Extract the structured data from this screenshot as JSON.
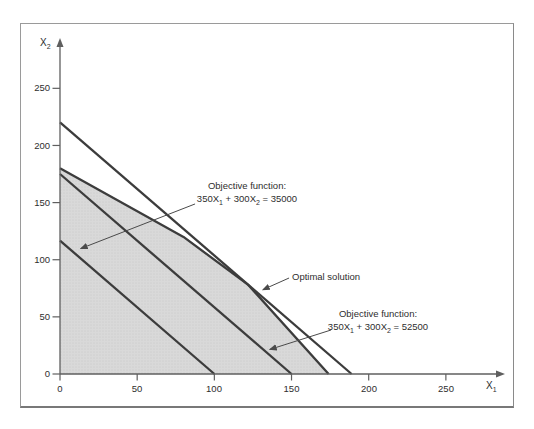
{
  "axes": {
    "x_axis_label": {
      "base": "X",
      "sub": "1"
    },
    "y_axis_label": {
      "base": "X",
      "sub": "2"
    }
  },
  "annotations": {
    "obj35000": {
      "line1": "Objective function:",
      "f1": "350X",
      "f1sub": "1",
      "f2": " + 300X",
      "f2sub": "2",
      "f3": " = 35000"
    },
    "obj52500": {
      "line1": "Objective function:",
      "f1": "350X",
      "f1sub": "1",
      "f2": " + 300X",
      "f2sub": "2",
      "f3": " = 52500"
    },
    "optimal": {
      "label": "Optimal solution"
    }
  },
  "colors": {
    "region_fill": "#d9d9d9",
    "region_dot": "#c6c6c6",
    "line": "#3c3c3c",
    "axis": "#5f5f5f",
    "leader": "#4a4a4a",
    "frame": "#9a9a9a"
  },
  "chart_data": {
    "type": "line",
    "title": "",
    "xlabel": "X1",
    "ylabel": "X2",
    "xlim": [
      0,
      285
    ],
    "ylim": [
      0,
      292
    ],
    "x_ticks": [
      0,
      50,
      100,
      150,
      200,
      250
    ],
    "y_ticks": [
      0,
      50,
      100,
      150,
      200,
      250
    ],
    "grid": false,
    "legend": false,
    "feasible_region": {
      "shaded": true,
      "vertices": [
        [
          0,
          0
        ],
        [
          0,
          180
        ],
        [
          80,
          120
        ],
        [
          122,
          78
        ],
        [
          174,
          0
        ]
      ]
    },
    "series": [
      {
        "name": "objective-level-curve-35000",
        "label": "350X1 + 300X2 = 35000",
        "points": [
          [
            0,
            116.7
          ],
          [
            100,
            0
          ]
        ]
      },
      {
        "name": "objective-level-curve-52500",
        "label": "350X1 + 300X2 = 52500",
        "points": [
          [
            0,
            175
          ],
          [
            150,
            0
          ]
        ]
      },
      {
        "name": "objective-level-curve-optimal",
        "label": "level curve through optimal solution",
        "points": [
          [
            0,
            220.3
          ],
          [
            188.9,
            0
          ]
        ]
      }
    ],
    "optimal_solution_point": [
      122,
      78
    ],
    "annotations": [
      {
        "target": "objective-level-curve-35000",
        "from": [
          87.5,
          148.8
        ],
        "to": [
          13.5,
          109.8
        ]
      },
      {
        "target": "objective-level-curve-52500",
        "from": [
          175.6,
          38.5
        ],
        "to": [
          136.0,
          21.5
        ]
      },
      {
        "target": "optimal-solution-point",
        "from": [
          148.4,
          84.0
        ],
        "to": [
          131.5,
          73.8
        ]
      }
    ]
  }
}
